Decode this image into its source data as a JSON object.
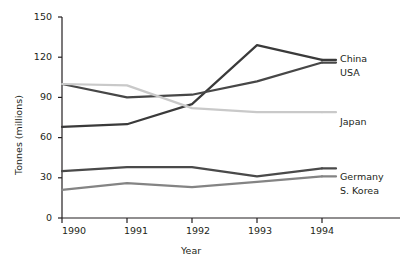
{
  "chart_data": {
    "type": "line",
    "title": "",
    "xlabel": "Year",
    "ylabel": "Tonnes (millions)",
    "categories": [
      "1990",
      "1991",
      "1992",
      "1993",
      "1994"
    ],
    "x": [
      1990,
      1991,
      1992,
      1993,
      1994
    ],
    "xlim": [
      1990,
      1994
    ],
    "ylim": [
      0,
      150
    ],
    "yticks": [
      "0",
      "30",
      "60",
      "90",
      "120",
      "150"
    ],
    "ytick_values": [
      0,
      30,
      60,
      90,
      120,
      150
    ],
    "xticks": [
      "1990",
      "1991",
      "1992",
      "1993",
      "1994"
    ],
    "grid": false,
    "legend_position": "right-inline-labels",
    "series": [
      {
        "name": "China",
        "values": [
          68,
          70,
          85,
          129,
          118
        ],
        "color": "#3a3a3a",
        "label_value": "China"
      },
      {
        "name": "USA",
        "values": [
          100,
          90,
          92,
          102,
          116
        ],
        "color": "#474747",
        "label_value": "USA"
      },
      {
        "name": "Japan",
        "values": [
          100,
          99,
          82,
          79,
          79
        ],
        "color": "#c9c9c9",
        "label_value": "Japan"
      },
      {
        "name": "Germany",
        "values": [
          35,
          38,
          38,
          31,
          37
        ],
        "color": "#4a4a4a",
        "label_value": "Germany"
      },
      {
        "name": "S. Korea",
        "values": [
          21,
          26,
          23,
          27,
          31
        ],
        "color": "#848484",
        "label_value": "S. Korea"
      }
    ],
    "axis_color": "#231f20",
    "background": "#ffffff"
  },
  "axes": {
    "y_title": "Tonnes (millions)",
    "x_title": "Year",
    "y_labels": {
      "t0": "0",
      "t1": "30",
      "t2": "60",
      "t3": "90",
      "t4": "120",
      "t5": "150"
    },
    "x_labels": {
      "x0": "1990",
      "x1": "1991",
      "x2": "1992",
      "x3": "1993",
      "x4": "1994"
    }
  },
  "series_labels": {
    "china": "China",
    "usa": "USA",
    "japan": "Japan",
    "germany": "Germany",
    "skorea": "S. Korea"
  }
}
